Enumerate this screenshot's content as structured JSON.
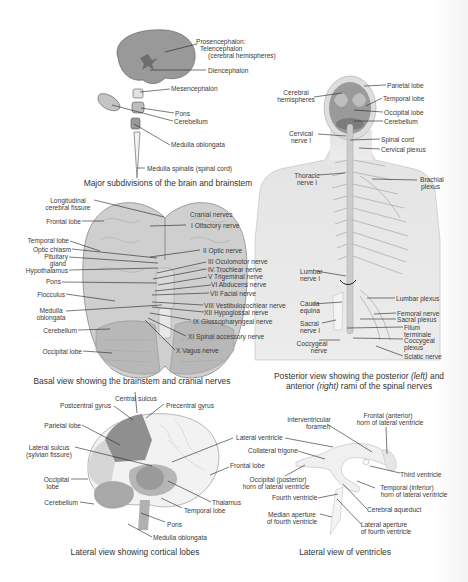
{
  "panels": {
    "subdivisions": {
      "caption": "Major subdivisions of the brain and brainstem",
      "labels": {
        "prosencephalon": "Prosencephalon:",
        "telencephalon": "Telencephalon",
        "cerebral_hemispheres": "(cerebral hemispheres)",
        "diencephalon": "Diencephalon",
        "mesencephalon": "Mesencephalon",
        "pons": "Pons",
        "cerebellum": "Cerebellum",
        "medulla_oblongata": "Medulla oblongata",
        "medulla_spinalis": "Medulla spinalis (spinal cord)"
      }
    },
    "basal": {
      "caption": "Basal view showing the brainstem and cranial nerves",
      "left_labels": {
        "longitudinal_1": "Longitudinal",
        "longitudinal_2": "cerebral fissure",
        "frontal_lobe": "Frontal lobe",
        "temporal_lobe": "Temporal lobe",
        "optic_chiasm": "Optic chiasm",
        "pituitary_1": "Pituitary",
        "pituitary_2": "gland",
        "hypothalamus": "Hypothalamus",
        "pons": "Pons",
        "flocculus": "Flocculus",
        "medulla_1": "Medulla",
        "medulla_2": "oblongata",
        "cerebellum": "Cerebellum",
        "occipital_lobe": "Occipital lobe"
      },
      "right_labels": {
        "cranial_nerves": "Cranial nerves",
        "n1": "I Olfactory nerve",
        "n2": "II Optic nerve",
        "n3": "III Oculomotor nerve",
        "n4": "IV Trochlear nerve",
        "n5": "V Trigeminal nerve",
        "n6": "VI Abducens nerve",
        "n7": "VII Facial nerve",
        "n8": "VIII Vestibulocochlear nerve",
        "n12": "XII Hypoglossal nerve",
        "n9": "IX Glossopharyngeal nerve",
        "n11": "XI Spinal accessory nerve",
        "n10": "X Vagus nerve"
      }
    },
    "posterior": {
      "caption_1_a": "Posterior view showing the posterior ",
      "caption_1_b": "(left)",
      "caption_1_c": " and",
      "caption_2_a": "anterior ",
      "caption_2_b": "(right)",
      "caption_2_c": " rami of the spinal nerves",
      "left_labels": {
        "cerebral_1": "Cerebral",
        "cerebral_2": "hemispheres",
        "cervical_1": "Cervical",
        "cervical_2": "nerve I",
        "thoracic_1": "Thoracic",
        "thoracic_2": "nerve I",
        "lumbar_1": "Lumbar",
        "lumbar_2": "nerve I",
        "cauda_1": "Cauda",
        "cauda_2": "equina",
        "sacral_1": "Sacral",
        "sacral_2": "nerve I",
        "coccygeal_1": "Coccygeal",
        "coccygeal_2": "nerve"
      },
      "right_labels": {
        "parietal": "Parietal lobe",
        "temporal": "Temporal lobe",
        "occipital": "Occipital lobe",
        "cerebellum": "Cerebellum",
        "spinal_cord": "Spinal cord",
        "cervical_plexus": "Cervical plexus",
        "brachial_1": "Brachial",
        "brachial_2": "plexus",
        "lumbar_plexus": "Lumbar plexus",
        "femoral": "Femoral nerve",
        "sacral_plexus": "Sacral plexus",
        "filum_1": "Filum",
        "filum_2": "terminale",
        "coccygeal_1": "Coccygeal",
        "coccygeal_2": "plexus",
        "sciatic": "Sciatic nerve"
      }
    },
    "lateral": {
      "caption": "Lateral view showing cortical lobes",
      "labels": {
        "central_sulcus": "Central sulcus",
        "postcentral": "Postcentral gyrus",
        "precentral": "Precentral gyrus",
        "parietal": "Parietal lobe",
        "lateral_sulcus_1": "Lateral sulcus",
        "lateral_sulcus_2": "(sylvian fissure)",
        "occipital_1": "Occipital",
        "occipital_2": "lobe",
        "cerebellum": "Cerebellum",
        "frontal": "Frontal lobe",
        "thalamus": "Thalamus",
        "temporal": "Temporal lobe",
        "pons": "Pons",
        "medulla": "Medulla oblongata"
      }
    },
    "ventricles": {
      "caption": "Lateral view of ventricles",
      "labels": {
        "interventricular_1": "Interventricular",
        "interventricular_2": "foramen",
        "frontal_horn_1": "Frontal (anterior)",
        "frontal_horn_2": "horn of lateral ventricle",
        "lateral_ventricle": "Lateral ventricle",
        "collateral_trigone": "Collateral trigone",
        "third_ventricle": "Third ventricle",
        "occipital_horn_1": "Occipital (posterior)",
        "occipital_horn_2": "horn of lateral ventricle",
        "temporal_horn_1": "Temporal (inferior)",
        "temporal_horn_2": "horn of lateral ventricle",
        "fourth_ventricle": "Fourth ventricle",
        "cerebral_aqueduct": "Cerebral aqueduct",
        "median_aperture_1": "Median aperture",
        "median_aperture_2": "of fourth ventricle",
        "lateral_aperture_1": "Lateral aperture",
        "lateral_aperture_2": "of fourth ventricle"
      }
    }
  },
  "colors": {
    "dark_fill": "#8e8e8e",
    "mid_fill": "#b3b3b3",
    "light_fill": "#d9d9d9",
    "skin": "#e6e6e6",
    "leader_line": "#222222",
    "text": "#3a3a3a"
  }
}
